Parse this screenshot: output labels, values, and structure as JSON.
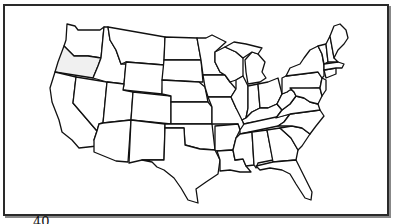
{
  "map": {
    "title": "United States outline map",
    "highlighted_state": "Oregon",
    "highlight_color": "#f0f0f0",
    "outline_color": "#111111",
    "background_color": "#ffffff",
    "frame_color": "#2a2a2a"
  },
  "footer": {
    "number_label": "40"
  }
}
